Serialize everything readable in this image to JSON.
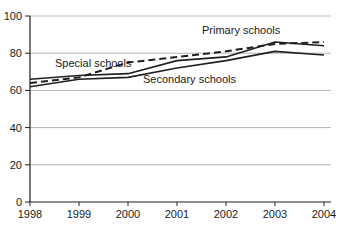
{
  "chart_data": {
    "type": "line",
    "title": "",
    "xlabel": "",
    "ylabel": "",
    "x": [
      1998,
      1999,
      2000,
      2001,
      2002,
      2003,
      2004
    ],
    "x_tick_labels": [
      "1998",
      "1999",
      "2000",
      "2001",
      "2002",
      "2003",
      "2004"
    ],
    "yticks": [
      0,
      20,
      40,
      60,
      80,
      100
    ],
    "y_tick_labels": [
      "0",
      "20",
      "40",
      "60",
      "80",
      "100"
    ],
    "ylim": [
      0,
      100
    ],
    "grid": true,
    "legend_position": "inline-labels",
    "series": [
      {
        "name": "Primary schools",
        "style": "solid",
        "values": [
          66,
          68,
          69,
          76,
          78,
          86,
          84
        ],
        "label": {
          "text": "Primary schools",
          "px": 202,
          "py": 34
        }
      },
      {
        "name": "Special schools",
        "style": "dashed",
        "values": [
          64,
          67,
          75,
          78,
          81,
          85,
          86
        ],
        "label": {
          "text": "Special schools",
          "px": 55,
          "py": 67
        }
      },
      {
        "name": "Secondary schools",
        "style": "solid",
        "values": [
          62,
          66,
          67,
          72,
          76,
          81,
          79
        ],
        "label": {
          "text": "Secondary schools",
          "px": 143,
          "py": 83
        }
      }
    ],
    "colors": {
      "line": "#1f1f1f",
      "grid": "#b3b3b3",
      "axis": "#1f1f1f",
      "background": "#ffffff",
      "text": "#1a1a1a"
    }
  }
}
